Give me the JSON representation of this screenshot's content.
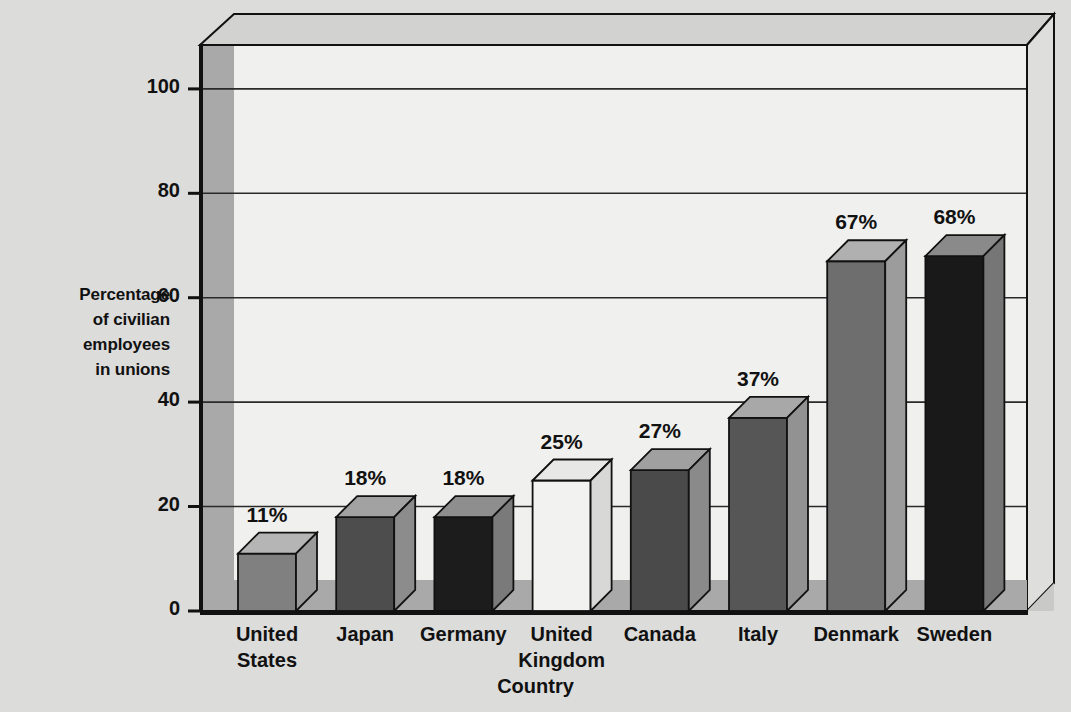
{
  "chart_data": {
    "type": "bar",
    "title": "",
    "xlabel": "Country",
    "ylabel": "Percentage of civilian employees in unions",
    "ylabel_lines": [
      "Percentage",
      "of civilian",
      "employees",
      "in unions"
    ],
    "categories": [
      "United States",
      "Japan",
      "Germany",
      "United Kingdom",
      "Canada",
      "Italy",
      "Denmark",
      "Sweden"
    ],
    "category_lines": [
      [
        "United",
        "States"
      ],
      [
        "Japan"
      ],
      [
        "Germany"
      ],
      [
        "United",
        "Kingdom"
      ],
      [
        "Canada"
      ],
      [
        "Italy"
      ],
      [
        "Denmark"
      ],
      [
        "Sweden"
      ]
    ],
    "values": [
      11,
      18,
      18,
      25,
      27,
      37,
      67,
      68
    ],
    "value_labels": [
      "11%",
      "18%",
      "18%",
      "25%",
      "27%",
      "37%",
      "67%",
      "68%"
    ],
    "ylim": [
      0,
      110
    ],
    "yticks": [
      0,
      20,
      40,
      60,
      80,
      100
    ],
    "ytick_labels": [
      "0",
      "20",
      "40",
      "60",
      "80",
      "100"
    ],
    "grid": true,
    "legend": "none",
    "bar_colors": [
      "#808080",
      "#4d4d4d",
      "#1c1c1c",
      "#f2f2f0",
      "#4a4a4a",
      "#565656",
      "#6e6e6e",
      "#191919"
    ],
    "bar_top_colors": [
      "#b5b5b5",
      "#a2a2a2",
      "#8e8e8e",
      "#e8e8e6",
      "#a0a0a0",
      "#a8a8a8",
      "#b0b0b0",
      "#8a8a8a"
    ],
    "bar_side_colors": [
      "#9a9a9a",
      "#8c8c8c",
      "#7a7a7a",
      "#d8d8d6",
      "#8a8a8a",
      "#929292",
      "#9c9c9c",
      "#767676"
    ]
  },
  "colors": {
    "page_background": "#dcdcdb",
    "plot_background": "#f0f0ee",
    "wall_shade": "#a9a9a9",
    "floor_shade": "#a9a9a9",
    "axis_line": "#111111",
    "grid_line": "#2a2a2a",
    "text": "#111111"
  },
  "bleed_text": {
    "lines": [
      "working in the same occupation in a...",
      "labor market between 1940 and 1980. In contrast",
      "there are also the largest movements of these labor",
      "unions of the United States where membership has",
      "most powerful in the unionized sector are those who",
      "in the general trend is the ongoing importance of the",
      "differences in the supply curve of labor in the internal",
      "increasing rate of unionization since 1960. The union",
      "of skills. As a result, the percentage of workers",
      "national wage at their own in the prior and the",
      "",
      "membership and union density differ in countries",
      "and the structure of bargaining as well as the",
      "historical patterns of the labor movement in each"
    ]
  }
}
